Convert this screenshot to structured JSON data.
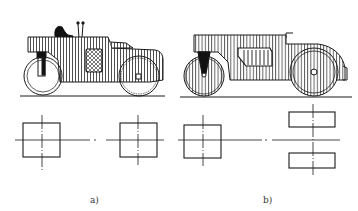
{
  "figure": {
    "panels": [
      {
        "id": "a",
        "label": "a)",
        "side_view": "tandem road roller with one cab, front guide roller with fork and rear drive drum",
        "plan_view": "two square drums aligned on a common longitudinal axis"
      },
      {
        "id": "b",
        "label": "b)",
        "side_view": "tandem road roller with enclosed body, front guide roller with fork and large rear drum",
        "plan_view": "one square front drum and two split rectangular rear drums on a common axis"
      }
    ],
    "colors": {
      "line": "#1a1a1a",
      "background": "#ffffff",
      "hatch": "#222222"
    }
  }
}
